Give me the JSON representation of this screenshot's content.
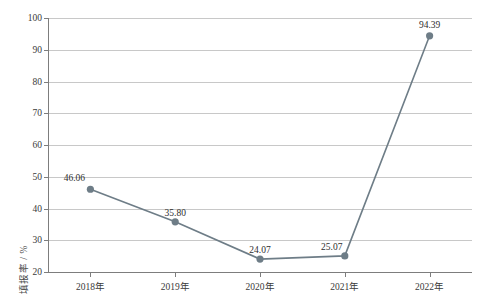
{
  "chart_data": {
    "type": "line",
    "title": "",
    "xlabel": "",
    "ylabel": "填报率 / %",
    "categories": [
      "2018年",
      "2019年",
      "2020年",
      "2021年",
      "2022年"
    ],
    "values": [
      46.06,
      35.8,
      24.07,
      25.07,
      94.39
    ],
    "point_labels": [
      "46.06",
      "35.80",
      "24.07",
      "25.07",
      "94.39"
    ],
    "ylim": [
      20,
      100
    ],
    "yticks": [
      20,
      30,
      40,
      50,
      60,
      70,
      80,
      90,
      100
    ],
    "ytick_labels": [
      "20",
      "30",
      "40",
      "50",
      "60",
      "70",
      "80",
      "90",
      "100"
    ],
    "grid": true,
    "legend": false,
    "series_color": "#6e7d87",
    "grid_color": "#c8c8c8",
    "axis_color": "#7d7d7d"
  }
}
